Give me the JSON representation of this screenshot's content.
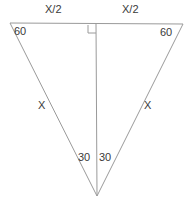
{
  "diagram": {
    "background_color": "#ffffff",
    "stroke_color": "#9a9a9a",
    "text_color": "#3a3a3a",
    "labels": {
      "top_left_segment": "X/2",
      "top_right_segment": "X/2",
      "angle_top_left": "60",
      "angle_top_right": "60",
      "side_left": "X",
      "side_right": "X",
      "angle_apex_left": "30",
      "angle_apex_right": "30"
    },
    "geometry": {
      "vertex_top_left": [
        10,
        23
      ],
      "vertex_top_right": [
        183,
        24
      ],
      "vertex_apex": [
        97,
        196
      ],
      "altitude_foot": [
        96,
        24
      ],
      "right_angle_marker": {
        "x": 88,
        "y": 25,
        "size": 8,
        "corner": "bottom-right"
      }
    }
  }
}
